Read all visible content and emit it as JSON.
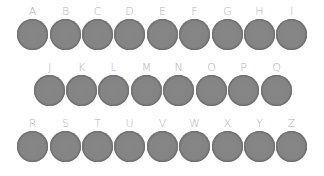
{
  "keyboard": {
    "rows": [
      {
        "keys": [
          "A",
          "B",
          "C",
          "D",
          "E",
          "F",
          "G",
          "H",
          "I"
        ]
      },
      {
        "keys": [
          "J",
          "K",
          "L",
          "M",
          "N",
          "O",
          "P",
          "Q"
        ]
      },
      {
        "keys": [
          "R",
          "S",
          "T",
          "U",
          "V",
          "W",
          "X",
          "Y",
          "Z"
        ]
      }
    ]
  },
  "colors": {
    "disc": "#808080",
    "disc_ring": "#737373",
    "label": "#b4b4b4",
    "background": "#ffffff"
  }
}
